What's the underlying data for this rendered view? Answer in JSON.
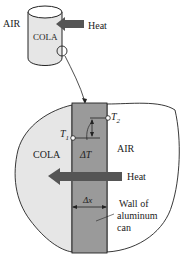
{
  "figure": {
    "top_view": {
      "outside_label": "AIR",
      "inside_label": "COLA",
      "heat_label": "Heat"
    },
    "detail_view": {
      "inside_label": "COLA",
      "outside_label": "AIR",
      "heat_label": "Heat",
      "t1_label": "T",
      "t1_sub": "1",
      "t2_label": "T",
      "t2_sub": "2",
      "delta_t_label": "ΔT",
      "delta_x_label": "Δx",
      "wall_label_lines": [
        "Wall of",
        "aluminum",
        "can"
      ]
    },
    "colors": {
      "cola_fill": "#e6e6e6",
      "wall_fill": "#9a9a9a",
      "arrow_fill": "#555555",
      "line": "#222222"
    }
  }
}
